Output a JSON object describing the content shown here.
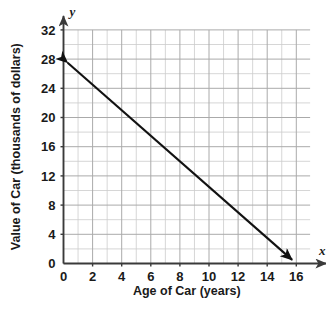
{
  "chart_data": {
    "type": "line",
    "title": "",
    "xlabel": "Age of Car (years)",
    "ylabel": "Value of Car (thousands of dollars)",
    "x_axis_name": "x",
    "y_axis_name": "y",
    "xlim": [
      0,
      18
    ],
    "ylim": [
      0,
      32
    ],
    "x_tick_labels": [
      "0",
      "2",
      "4",
      "6",
      "8",
      "10",
      "12",
      "14",
      "16"
    ],
    "x_tick_values": [
      0,
      2,
      4,
      6,
      8,
      10,
      12,
      14,
      16
    ],
    "y_tick_labels": [
      "0",
      "4",
      "8",
      "12",
      "16",
      "20",
      "24",
      "28",
      "32"
    ],
    "y_tick_values": [
      0,
      4,
      8,
      12,
      16,
      20,
      24,
      28,
      32
    ],
    "x_minor_step": 1,
    "y_minor_step": 2,
    "grid": true,
    "legend": "none",
    "series": [
      {
        "name": "Value of Car",
        "x": [
          0,
          16
        ],
        "values": [
          28,
          0
        ],
        "slope": -1.75,
        "intercept": 28,
        "double_arrow": true,
        "color": "#111111"
      }
    ],
    "colors": {
      "line": "#111111",
      "axis": "#3a3a3a",
      "grid_minor": "#cccccc",
      "grid_major": "#aaaaaa",
      "text": "#1a1a1a",
      "background": "#ffffff"
    }
  }
}
